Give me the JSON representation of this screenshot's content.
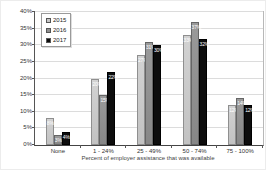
{
  "chart_data": {
    "type": "bar",
    "title": "",
    "xlabel": "Percent of employer assistance that was available",
    "ylabel": "Percent of respondents",
    "categories": [
      "None",
      "1 - 24%",
      "25 - 49%",
      "50 - 74%",
      "75 - 100%"
    ],
    "series": [
      {
        "name": "2015",
        "color": "#c6c6c6",
        "values": [
          8,
          20,
          27,
          33,
          12
        ]
      },
      {
        "name": "2016",
        "color": "#8f8f8f",
        "values": [
          3,
          15,
          31,
          37,
          14
        ]
      },
      {
        "name": "2017",
        "color": "#0d0d0d",
        "values": [
          4,
          22,
          30,
          32,
          12
        ]
      }
    ],
    "data_labels": [
      "8%",
      "3%",
      "4%",
      "20%",
      "15%",
      "22%",
      "27%",
      "31%",
      "30%",
      "33%",
      "37%",
      "32%",
      "12%",
      "14%",
      "12%"
    ],
    "ylim": [
      0,
      40
    ],
    "ytick_step": 5,
    "ytick_suffix": "%",
    "grid": true,
    "legend_position": "top-left"
  }
}
